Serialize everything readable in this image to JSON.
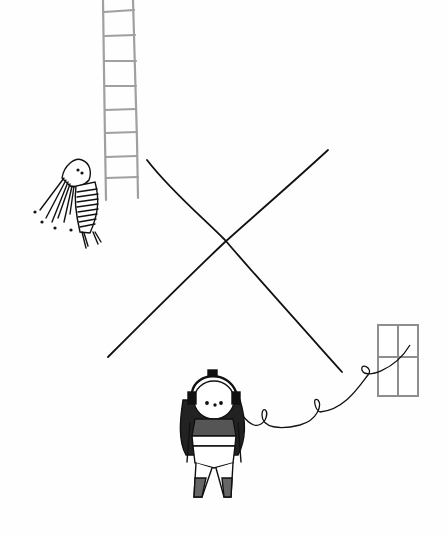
{
  "illustration": {
    "title": "",
    "background": "#fefefe",
    "ink_color": "#111111",
    "gray_color": "#9a9a9a",
    "elements": [
      "ladder",
      "hanging-girl",
      "cross-lines",
      "window",
      "headphone-girl",
      "headphone-cord"
    ]
  }
}
